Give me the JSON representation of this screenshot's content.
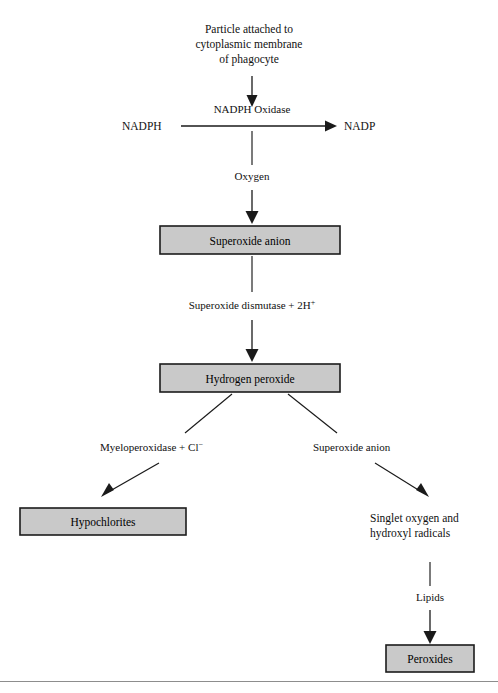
{
  "diagram": {
    "colors": {
      "box_fill": "#c9c9c9",
      "box_stroke": "#1c1c1c",
      "line": "#1a1a1a",
      "background": "#ffffff",
      "rule": "#8d8d8d"
    },
    "nodes": {
      "start": {
        "lines": [
          "Particle attached to",
          "cytoplasmic membrane",
          "of phagocyte"
        ]
      },
      "nadph": {
        "label": "NADPH"
      },
      "nadp": {
        "label": "NADP"
      },
      "superoxide_anion_box": {
        "label": "Superoxide anion"
      },
      "hydrogen_peroxide_box": {
        "label": "Hydrogen peroxide"
      },
      "hypochlorites_box": {
        "label": "Hypochlorites"
      },
      "singlet_oxygen": {
        "lines": [
          "Singlet oxygen and",
          "hydroxyl radicals"
        ]
      },
      "peroxides_box": {
        "label": "Peroxides"
      }
    },
    "edge_labels": {
      "nadph_oxidase": "NADPH Oxidase",
      "oxygen": "Oxygen",
      "superoxide_dismutase_main": "Superoxide dismutase + 2H",
      "superoxide_dismutase_sup": "+",
      "myeloperoxidase_main": "Myeloperoxidase + Cl",
      "myeloperoxidase_sup": "−",
      "superoxide_anion_branch": "Superoxide anion",
      "lipids": "Lipids"
    }
  }
}
